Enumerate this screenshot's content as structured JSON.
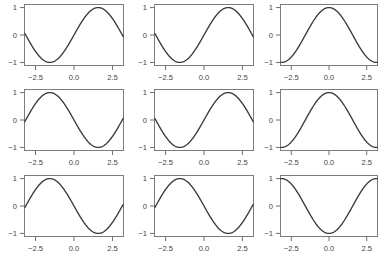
{
  "figure": {
    "title": "",
    "background": "#ffffff",
    "rows": 3,
    "cols": 3,
    "curve_color": "#3a3a3a",
    "frame_color": "#7d7d7d",
    "tick_color": "#6f6f6f",
    "label_color": "#3f3f3f"
  },
  "axes": {
    "xlim": [
      -3.25,
      3.25
    ],
    "ylim": [
      -1.13,
      1.13
    ],
    "xticks": [
      -2.5,
      0.0,
      2.5
    ],
    "xticklabels": [
      "−2.5",
      "0.0",
      "2.5"
    ],
    "yticks": [
      -1,
      0,
      1
    ],
    "yticklabels": [
      "−1",
      "0",
      "1"
    ],
    "grid": false,
    "xlabel": "",
    "ylabel": ""
  },
  "chart_data": {
    "type": "line",
    "title": "",
    "xlabel": "",
    "ylabel": "",
    "xlim": [
      -3.25,
      3.25
    ],
    "ylim": [
      -1.13,
      1.13
    ],
    "grid": false,
    "legend": "none",
    "x_domain": [
      -3.2,
      3.2
    ],
    "n_points": 201,
    "panels": [
      {
        "index": 0,
        "row": 0,
        "col": 0,
        "name": "panel-r1c1",
        "expression": "sin(x)",
        "amplitude": 1,
        "phase": 0,
        "frequency": 1,
        "xticklabels": [
          "−2.5",
          "0.0",
          "2.5"
        ],
        "yticklabels": [
          "−1",
          "0",
          "1"
        ]
      },
      {
        "index": 1,
        "row": 0,
        "col": 1,
        "name": "panel-r1c2",
        "expression": "sin(x)",
        "amplitude": 1,
        "phase": 0,
        "frequency": 1,
        "xticklabels": [
          "−2.5",
          "0.0",
          "2.5"
        ],
        "yticklabels": [
          "−1",
          "0",
          "1"
        ]
      },
      {
        "index": 2,
        "row": 0,
        "col": 2,
        "name": "panel-r1c3",
        "expression": "cos(x)",
        "amplitude": 1,
        "phase": 1.5707963268,
        "frequency": 1,
        "xticklabels": [
          "−2.5",
          "0.0",
          "2.5"
        ],
        "yticklabels": [
          "−1",
          "0",
          "1"
        ]
      },
      {
        "index": 3,
        "row": 1,
        "col": 0,
        "name": "panel-r2c1",
        "expression": "-sin(x)",
        "amplitude": 1,
        "phase": 3.1415926536,
        "frequency": 1,
        "xticklabels": [
          "−2.5",
          "0.0",
          "2.5"
        ],
        "yticklabels": [
          "−1",
          "0",
          "1"
        ]
      },
      {
        "index": 4,
        "row": 1,
        "col": 1,
        "name": "panel-r2c2",
        "expression": "sin(x)",
        "amplitude": 1,
        "phase": 0,
        "frequency": 1,
        "xticklabels": [
          "−2.5",
          "0.0",
          "2.5"
        ],
        "yticklabels": [
          "−1",
          "0",
          "1"
        ]
      },
      {
        "index": 5,
        "row": 1,
        "col": 2,
        "name": "panel-r2c3",
        "expression": "cos(x)",
        "amplitude": 1,
        "phase": 1.5707963268,
        "frequency": 1,
        "xticklabels": [
          "−2.5",
          "0.0",
          "2.5"
        ],
        "yticklabels": [
          "−1",
          "0",
          "1"
        ]
      },
      {
        "index": 6,
        "row": 2,
        "col": 0,
        "name": "panel-r3c1",
        "expression": "-sin(x)",
        "amplitude": 1,
        "phase": 3.1415926536,
        "frequency": 1,
        "xticklabels": [
          "−2.5",
          "0.0",
          "2.5"
        ],
        "yticklabels": [
          "−1",
          "0",
          "1"
        ]
      },
      {
        "index": 7,
        "row": 2,
        "col": 1,
        "name": "panel-r3c2",
        "expression": "-sin(x)",
        "amplitude": 1,
        "phase": 3.1415926536,
        "frequency": 1,
        "xticklabels": [
          "−2.5",
          "0.0",
          "2.5"
        ],
        "yticklabels": [
          "−1",
          "0",
          "1"
        ]
      },
      {
        "index": 8,
        "row": 2,
        "col": 2,
        "name": "panel-r3c3",
        "expression": "-cos(x)",
        "amplitude": 1,
        "phase": 4.7123889804,
        "frequency": 1,
        "xticklabels": [
          "−2.5",
          "0.0",
          "2.5"
        ],
        "yticklabels": [
          "−1",
          "0",
          "1"
        ]
      }
    ]
  },
  "layout": {
    "panel_geometry": [
      {
        "left": 24,
        "top": 4,
        "width": 100,
        "height": 62
      },
      {
        "left": 154,
        "top": 4,
        "width": 100,
        "height": 62
      },
      {
        "left": 280,
        "top": 4,
        "width": 98,
        "height": 62
      },
      {
        "left": 24,
        "top": 89,
        "width": 100,
        "height": 62
      },
      {
        "left": 154,
        "top": 89,
        "width": 100,
        "height": 62
      },
      {
        "left": 280,
        "top": 89,
        "width": 98,
        "height": 62
      },
      {
        "left": 24,
        "top": 175,
        "width": 100,
        "height": 62
      },
      {
        "left": 154,
        "top": 175,
        "width": 100,
        "height": 62
      },
      {
        "left": 280,
        "top": 175,
        "width": 98,
        "height": 62
      }
    ]
  }
}
